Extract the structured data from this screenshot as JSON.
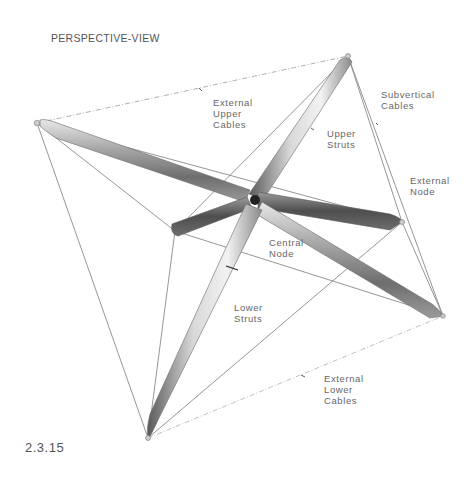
{
  "title": "PERSPECTIVE-VIEW",
  "figure_number": "2.3.15",
  "labels": {
    "external_upper_cables": "External\nUpper\nCables",
    "subvertical_cables": "Subvertical\nCables",
    "upper_struts": "Upper\nStruts",
    "external_node": "External\nNode",
    "central_node": "Central\nNode",
    "lower_struts": "Lower\nStruts",
    "external_lower_cables": "External\nLower\nCables"
  },
  "colors": {
    "cable": "#8a8a8a",
    "cable_dashed": "#b5b5b5",
    "strut_dark": "#4a4a4a",
    "strut_mid": "#8c8c8c",
    "strut_light": "#e6e6e6",
    "text": "#666666"
  }
}
